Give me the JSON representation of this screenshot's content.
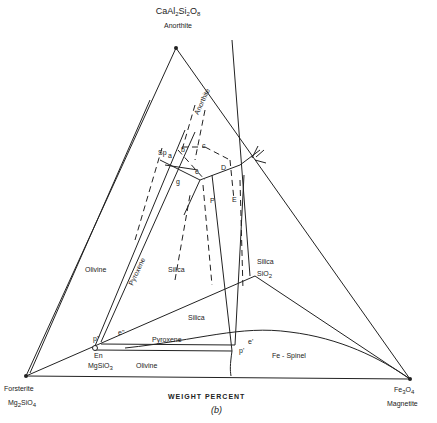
{
  "figure": {
    "panel_label": "(b)",
    "axis_caption": "WEIGHT PERCENT"
  },
  "vertices": {
    "top": {
      "formula_html": "CaAl<sub>2</sub>Si<sub>2</sub>O<sub>8</sub>",
      "name": "Anorthite"
    },
    "left": {
      "name": "Forsterite",
      "formula_html": "Mg<sub>2</sub>SiO<sub>4</sub>"
    },
    "right": {
      "formula_html": "Fe<sub>3</sub>O<sub>4</sub>",
      "name": "Magnetite"
    }
  },
  "compounds": {
    "enstatite": {
      "abbr": "En",
      "formula_html": "MgSiO<sub>3</sub>"
    },
    "silica": {
      "name": "Silica",
      "formula_html": "SiO<sub>2</sub>"
    }
  },
  "fields": {
    "anorthite": "Anorthite",
    "olivine_upper": "Olivine",
    "pyroxene_upper": "Pyroxene",
    "silica_upper": "Silica",
    "silica_lower": "Silica",
    "pyroxene_lower": "Pyroxene",
    "olivine_lower": "Olivine",
    "fe_spinel": "Fe - Spinel"
  },
  "points": {
    "sp": "Sp",
    "a": "a",
    "b": "b",
    "c": "c",
    "d": "D",
    "e_small": "e",
    "g": "g",
    "p": "P",
    "e": "E",
    "p2": "p\"",
    "e2": "e\"",
    "p1": "p'",
    "e1": "e'"
  }
}
